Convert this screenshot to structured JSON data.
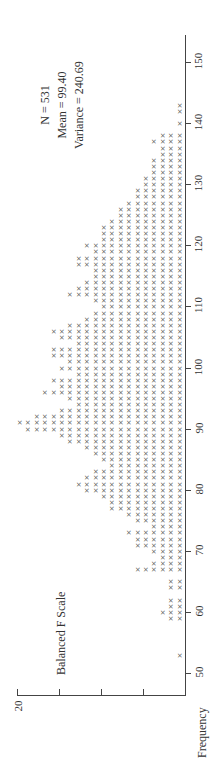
{
  "chart_data": {
    "type": "scatter",
    "subtype": "dot-plot (x marks), rotated 90° counterclockwise",
    "title": "Balanced F Scale",
    "xlabel": "",
    "ylabel": "Frequency",
    "x_ticks": [
      50,
      60,
      70,
      80,
      90,
      100,
      110,
      120,
      130,
      140,
      150
    ],
    "y_ticks": [
      0,
      5,
      10,
      15,
      20
    ],
    "y_tick_labels_shown": [
      "20"
    ],
    "xlim": [
      45,
      155
    ],
    "ylim": [
      0,
      20
    ],
    "stats": {
      "N": "N = 531",
      "mean": "Mean = 99.40",
      "variance": "Variance = 240.69"
    },
    "x": [
      53,
      59,
      60,
      61,
      62,
      64,
      65,
      67,
      68,
      69,
      70,
      71,
      72,
      73,
      74,
      75,
      76,
      77,
      78,
      79,
      80,
      81,
      82,
      83,
      84,
      85,
      86,
      87,
      88,
      89,
      90,
      91,
      92,
      93,
      94,
      95,
      96,
      97,
      98,
      99,
      100,
      101,
      102,
      103,
      104,
      105,
      106,
      107,
      108,
      109,
      110,
      111,
      112,
      113,
      114,
      115,
      116,
      117,
      118,
      119,
      120,
      121,
      122,
      123,
      124,
      125,
      126,
      127,
      128,
      129,
      130,
      131,
      132,
      133,
      134,
      135,
      136,
      137,
      138,
      140,
      142,
      143
    ],
    "values": [
      1,
      2,
      3,
      2,
      2,
      2,
      2,
      6,
      4,
      3,
      4,
      6,
      6,
      7,
      4,
      6,
      7,
      9,
      9,
      10,
      12,
      13,
      12,
      11,
      9,
      10,
      11,
      12,
      14,
      15,
      19,
      20,
      18,
      15,
      13,
      14,
      17,
      15,
      16,
      13,
      15,
      14,
      16,
      16,
      13,
      15,
      16,
      14,
      12,
      11,
      10,
      11,
      14,
      13,
      12,
      11,
      11,
      13,
      13,
      11,
      12,
      10,
      10,
      10,
      9,
      8,
      8,
      7,
      6,
      6,
      5,
      5,
      4,
      4,
      4,
      3,
      3,
      4,
      3,
      1,
      1,
      1
    ]
  },
  "labels": {
    "title": "Balanced F Scale",
    "ylabel": "Frequency",
    "y_top_tick": "20",
    "stat_n": "N = 531",
    "stat_mean": "Mean = 99.40",
    "stat_var": "Variance = 240.69"
  },
  "x_tick_labels": [
    "50",
    "60",
    "70",
    "80",
    "90",
    "100",
    "110",
    "120",
    "130",
    "140",
    "150"
  ]
}
